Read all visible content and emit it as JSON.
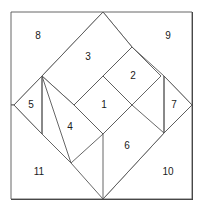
{
  "figure": {
    "name": "square-dissection-diagram",
    "width": 204,
    "height": 211,
    "background_color": "#ffffff",
    "border_color": "#3c3c3c",
    "line_color": "#555555",
    "label_color": "#1a1a1a",
    "frame": {
      "x": 11,
      "y": 12,
      "width": 181,
      "height": 187
    },
    "diamond": {
      "top": [
        103,
        12
      ],
      "right": [
        192,
        105
      ],
      "bottom": [
        103,
        199
      ],
      "left": [
        14,
        105
      ]
    },
    "pieces": [
      {
        "id": "1",
        "label": "1",
        "shape": "square",
        "points": "103,76 132,105 103,134 74,105",
        "label_x": 104,
        "label_y": 105
      },
      {
        "id": "2",
        "label": "2",
        "shape": "square",
        "points": "132,47 161,76 132,105 103,76",
        "label_x": 133,
        "label_y": 76
      },
      {
        "id": "3",
        "label": "3",
        "shape": "rectangle",
        "points": "103,12 132,47 74,105 42,76",
        "label_x": 88,
        "label_y": 57
      },
      {
        "id": "4",
        "label": "4",
        "shape": "rectangle",
        "points": "42,76 74,105 103,134 71,163",
        "label_x": 70,
        "label_y": 127
      },
      {
        "id": "5",
        "label": "5",
        "shape": "triangle",
        "points": "14,105 42,76 42,134",
        "label_x": 31,
        "label_y": 105
      },
      {
        "id": "6",
        "label": "6",
        "shape": "rectangle",
        "points": "103,134 132,105 164,133 103,199",
        "label_x": 127,
        "label_y": 146
      },
      {
        "id": "7",
        "label": "7",
        "shape": "triangle",
        "points": "164,76 192,105 164,133",
        "label_x": 174,
        "label_y": 105
      },
      {
        "id": "8",
        "label": "8",
        "shape": "corner-triangle",
        "points": "11,12 103,12 42,76 14,105 11,105",
        "label_x": 38,
        "label_y": 36
      },
      {
        "id": "9",
        "label": "9",
        "shape": "corner-triangle",
        "points": "103,12 192,12 192,105 164,76 132,47",
        "label_x": 168,
        "label_y": 36
      },
      {
        "id": "10",
        "label": "10",
        "shape": "corner-triangle",
        "points": "164,133 192,105 192,199 103,199",
        "label_x": 168,
        "label_y": 172
      },
      {
        "id": "11",
        "label": "11",
        "shape": "corner-triangle",
        "points": "11,105 14,105 42,134 71,163 103,199 11,199",
        "label_x": 39,
        "label_y": 172
      }
    ],
    "inner_lines": [
      {
        "name": "piece-5-chord",
        "x1": 42,
        "y1": 76,
        "x2": 42,
        "y2": 134
      },
      {
        "name": "piece-7-chord",
        "x1": 164,
        "y1": 76,
        "x2": 164,
        "y2": 133
      }
    ]
  }
}
